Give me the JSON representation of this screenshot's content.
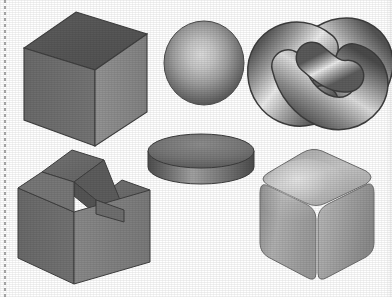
{
  "figure": {
    "background_color": "#ffffff",
    "width": 392,
    "height": 297,
    "margin_rule": {
      "name": "dotted-margin-rule",
      "style": "dotted",
      "color": "#9a9a9a",
      "orientation": "vertical",
      "position": "left"
    },
    "layout": {
      "columns": 3,
      "rows": 2,
      "shape_count": 6
    }
  },
  "shapes": [
    {
      "id": "cube",
      "label": "Cube",
      "row": 1,
      "column": 1,
      "shading": "flat",
      "bbox": {
        "x": 22,
        "y": 12,
        "width": 126,
        "height": 134
      },
      "colors": {
        "top_face": "#575757",
        "left_face": "#6e6e6e",
        "right_face": "#8c8c8c",
        "edge": "#3f3f3f"
      }
    },
    {
      "id": "sphere",
      "label": "Sphere",
      "row": 1,
      "column": 2,
      "shading": "smooth",
      "bbox": {
        "x": 163,
        "y": 21,
        "width": 80,
        "height": 83
      },
      "colors": {
        "highlight": "#d8d8d8",
        "midtone": "#9b9b9b",
        "shadow": "#5a5a5a",
        "rim": "#4a4a4a"
      }
    },
    {
      "id": "trefoil-knot",
      "label": "Trefoil Knot",
      "row": 1,
      "column": 3,
      "shading": "smooth",
      "bbox": {
        "x": 255,
        "y": 18,
        "width": 126,
        "height": 115
      },
      "colors": {
        "highlight": "#ececec",
        "midtone": "#a6a6a6",
        "shadow": "#4f4f4f",
        "rim": "#3d3d3d"
      }
    },
    {
      "id": "notched-block",
      "label": "Notched Block",
      "row": 2,
      "column": 1,
      "shading": "flat",
      "bbox": {
        "x": 16,
        "y": 148,
        "width": 136,
        "height": 140
      },
      "colors": {
        "top_face": "#6a6a6a",
        "left_face": "#6e6e6e",
        "right_face": "#818181",
        "inner_face": "#5e5e5e",
        "edge": "#3f3f3f"
      }
    },
    {
      "id": "cylinder",
      "label": "Cylinder",
      "row": 2,
      "column": 2,
      "shading": "smooth",
      "bbox": {
        "x": 146,
        "y": 121,
        "width": 108,
        "height": 68
      },
      "colors": {
        "top_face": "#7a7a7a",
        "side_highlight": "#a2a2a2",
        "side_shadow": "#4e4e4e",
        "edge": "#3c3c3c"
      }
    },
    {
      "id": "rounded-cube",
      "label": "Rounded Cube",
      "row": 2,
      "column": 3,
      "shading": "smooth",
      "bbox": {
        "x": 258,
        "y": 147,
        "width": 122,
        "height": 140
      },
      "colors": {
        "top_face": "#b4b4b4",
        "left_face": "#9c9c9c",
        "right_face": "#a8a8a8",
        "highlight": "#d6d6d6",
        "edge": "#6d6d6d"
      }
    }
  ]
}
